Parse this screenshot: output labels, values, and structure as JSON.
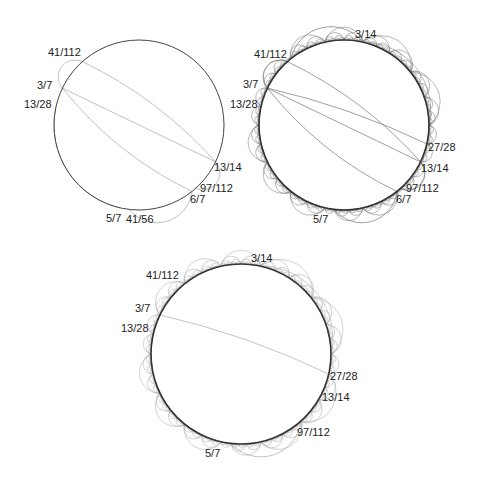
{
  "figure": {
    "panels": [
      {
        "id": "panel-1",
        "center": [
          139,
          125
        ],
        "radius": 85,
        "boundary_color": "#444444",
        "geodesic_color": "#b0b0b0",
        "labels": [
          {
            "text": "41/112",
            "frac": 0.36607,
            "pos": [
              48,
              56
            ]
          },
          {
            "text": "3/7",
            "frac": 0.42857,
            "pos": [
              37,
              89
            ]
          },
          {
            "text": "13/28",
            "frac": 0.46429,
            "pos": [
              24,
              108
            ]
          },
          {
            "text": "13/14",
            "frac": 0.92857,
            "pos": [
              214,
              171
            ]
          },
          {
            "text": "97/112",
            "frac": 0.86607,
            "pos": [
              200,
              192
            ]
          },
          {
            "text": "6/7",
            "frac": 0.85714,
            "pos": [
              190,
              203
            ]
          },
          {
            "text": "5/7",
            "frac": 0.71429,
            "pos": [
              106,
              222
            ]
          },
          {
            "text": "41/56",
            "frac": 0.73214,
            "pos": [
              126,
              223
            ]
          }
        ],
        "geodesics": [
          [
            0.36607,
            0.42857
          ],
          [
            0.42857,
            0.92857
          ],
          [
            0.36607,
            0.92857
          ],
          [
            0.42857,
            0.85714
          ],
          [
            0.46429,
            0.71429
          ],
          [
            0.73214,
            0.85714
          ],
          [
            0.86607,
            0.92857
          ]
        ],
        "dense": false
      },
      {
        "id": "panel-2",
        "center": [
          344,
          125
        ],
        "radius": 85,
        "boundary_color": "#333333",
        "geodesic_color": "#888888",
        "labels": [
          {
            "text": "3/14",
            "frac": 0.21429,
            "pos": [
              355,
              38
            ]
          },
          {
            "text": "41/112",
            "frac": 0.36607,
            "pos": [
              254,
              58
            ]
          },
          {
            "text": "3/7",
            "frac": 0.42857,
            "pos": [
              243,
              88
            ]
          },
          {
            "text": "13/28",
            "frac": 0.46429,
            "pos": [
              230,
              108
            ]
          },
          {
            "text": "27/28",
            "frac": 0.96429,
            "pos": [
              428,
              151
            ]
          },
          {
            "text": "13/14",
            "frac": 0.92857,
            "pos": [
              421,
              172
            ]
          },
          {
            "text": "97/112",
            "frac": 0.86607,
            "pos": [
              406,
              192
            ]
          },
          {
            "text": "6/7",
            "frac": 0.85714,
            "pos": [
              396,
              203
            ]
          },
          {
            "text": "5/7",
            "frac": 0.71429,
            "pos": [
              313,
              223
            ]
          }
        ],
        "geodesics": [
          [
            0.36607,
            0.42857
          ],
          [
            0.42857,
            0.92857
          ],
          [
            0.36607,
            0.92857
          ],
          [
            0.42857,
            0.85714
          ],
          [
            0.46429,
            0.71429
          ],
          [
            0.73214,
            0.85714
          ],
          [
            0.86607,
            0.92857
          ],
          [
            0.21429,
            0.96429
          ],
          [
            0.42857,
            0.96429
          ],
          [
            0.35714,
            0.21429
          ],
          [
            0.96429,
            0.71429
          ]
        ],
        "dense": true,
        "depth": 6
      },
      {
        "id": "panel-3",
        "center": [
          241,
          354
        ],
        "radius": 90,
        "boundary_color": "#333333",
        "geodesic_color": "#b4b4b4",
        "labels": [
          {
            "text": "3/14",
            "frac": 0.21429,
            "pos": [
              251,
              262
            ]
          },
          {
            "text": "41/112",
            "frac": 0.36607,
            "pos": [
              146,
              279
            ]
          },
          {
            "text": "3/7",
            "frac": 0.42857,
            "pos": [
              135,
              312
            ]
          },
          {
            "text": "13/28",
            "frac": 0.46429,
            "pos": [
              121,
              332
            ]
          },
          {
            "text": "27/28",
            "frac": 0.96429,
            "pos": [
              330,
              380
            ]
          },
          {
            "text": "13/14",
            "frac": 0.92857,
            "pos": [
              322,
              401
            ]
          },
          {
            "text": "97/112",
            "frac": 0.86607,
            "pos": [
              297,
              436
            ]
          },
          {
            "text": "5/7",
            "frac": 0.71429,
            "pos": [
              205,
              457
            ]
          }
        ],
        "geodesics": [
          [
            0.42857,
            0.96429
          ],
          [
            0.46429,
            0.71429
          ],
          [
            0.21429,
            0.96429
          ],
          [
            0.73214,
            0.86607
          ]
        ],
        "dense": true,
        "depth": 5
      }
    ]
  }
}
